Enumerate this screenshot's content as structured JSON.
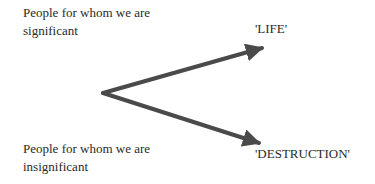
{
  "diagram": {
    "source_labels": {
      "significant": "People for whom we are significant",
      "insignificant": "People for whom we are insignificant"
    },
    "outcome_labels": {
      "life": "'LIFE'",
      "destruction": "'DESTRUCTION'"
    },
    "arrows": [
      {
        "from": "vertex",
        "to": "life"
      },
      {
        "from": "vertex",
        "to": "destruction"
      }
    ],
    "colors": {
      "arrow": "#4a4a4a",
      "text": "#2a2a2a"
    }
  }
}
